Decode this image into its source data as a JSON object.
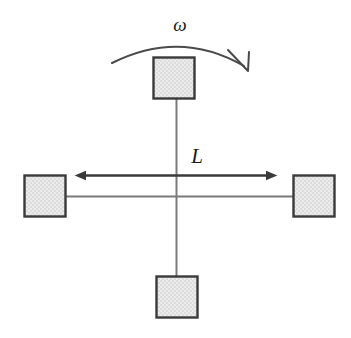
{
  "figure": {
    "background_color": "#ffffff",
    "width": 351,
    "height": 338
  },
  "style": {
    "block_fill_color": "#e3e3e3",
    "block_fill_pattern_color": "#f2f2f2",
    "block_border_color": "#3a3a3a",
    "rod_color": "#7a7a7a",
    "arrow_color": "#3a3a3a",
    "curve_color": "#4a4a4a",
    "label_color": "#1a1a1a"
  },
  "labels": {
    "angular_velocity": "ω",
    "length": "L"
  },
  "blocks": [
    {
      "name": "top-block",
      "x": 153,
      "y": 57,
      "width": 42,
      "height": 42
    },
    {
      "name": "left-block",
      "x": 24,
      "y": 175,
      "width": 42,
      "height": 42
    },
    {
      "name": "right-block",
      "x": 293,
      "y": 175,
      "width": 42,
      "height": 42
    },
    {
      "name": "bottom-block",
      "x": 156,
      "y": 276,
      "width": 42,
      "height": 42
    }
  ],
  "center": {
    "x": 176,
    "y": 196
  },
  "rods": [
    {
      "name": "rod-vertical",
      "x1": 176,
      "y1": 99,
      "x2": 177,
      "y2": 276
    },
    {
      "name": "rod-horizontal",
      "x1": 66,
      "y1": 196,
      "x2": 293,
      "y2": 196
    }
  ],
  "dimension_arrow": {
    "name": "length-dimension-arrow",
    "y": 175,
    "x_start": 84,
    "x_end": 268,
    "head_style": "solid-triangle",
    "double_headed": true
  },
  "rotation_arrow": {
    "name": "rotation-curved-arrow",
    "direction": "clockwise",
    "start_x": 112,
    "start_y": 63,
    "peak_x": 180,
    "peak_y": 41,
    "end_x": 246,
    "end_y": 69,
    "head_style": "open-v"
  },
  "label_positions": {
    "omega": {
      "x": 180,
      "y": 30
    },
    "length": {
      "x": 197,
      "y": 162
    }
  }
}
